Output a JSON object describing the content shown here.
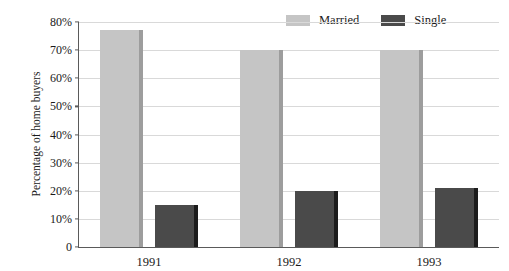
{
  "chart_data": {
    "type": "bar",
    "title": "",
    "subtitle": "",
    "xlabel": "",
    "ylabel": "Percentage of home buyers",
    "categories": [
      "1991",
      "1992",
      "1993"
    ],
    "series": [
      {
        "name": "Married",
        "values": [
          77,
          70,
          70
        ],
        "color": "#c5c5c5"
      },
      {
        "name": "Single",
        "values": [
          15,
          20,
          21
        ],
        "color": "#4a4a4a"
      }
    ],
    "ylim": [
      0,
      80
    ],
    "y_ticks": [
      0,
      10,
      20,
      30,
      40,
      50,
      60,
      70,
      80
    ],
    "y_tick_labels": [
      "0",
      "10%",
      "20%",
      "30%",
      "40%",
      "50%",
      "60%",
      "70%",
      "80%"
    ],
    "grid": true,
    "legend_position": "top-right",
    "value_suffix": "%"
  },
  "colors": {
    "married": "#c5c5c5",
    "married_edge": "#9d9d9d",
    "single": "#4a4a4a",
    "single_edge": "#1c1c1c",
    "gridline": "#d9d9d9",
    "axis": "#5a5a5a",
    "text": "#1a1a1a",
    "background": "#ffffff"
  }
}
